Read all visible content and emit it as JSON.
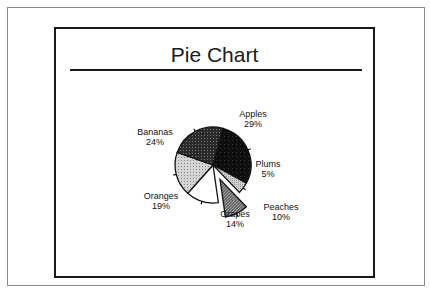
{
  "chart_data": {
    "type": "pie",
    "title": "Pie Chart",
    "slices": [
      {
        "label": "Apples",
        "value": 29,
        "text": "29%",
        "fill": "#111111",
        "pattern": "solid-dark",
        "exploded": false
      },
      {
        "label": "Plums",
        "value": 5,
        "text": "5%",
        "fill": "#c8c8c8",
        "pattern": "light",
        "exploded": false
      },
      {
        "label": "Peaches",
        "value": 10,
        "text": "10%",
        "fill": "#777777",
        "pattern": "hatch-mid",
        "exploded": true
      },
      {
        "label": "Grapes",
        "value": 14,
        "text": "14%",
        "fill": "#ffffff",
        "pattern": "none",
        "exploded": false
      },
      {
        "label": "Oranges",
        "value": 19,
        "text": "19%",
        "fill": "#c4c4c4",
        "pattern": "dots-light",
        "exploded": false
      },
      {
        "label": "Bananas",
        "value": 24,
        "text": "24%",
        "fill": "#3a3a3a",
        "pattern": "hatch-dark",
        "exploded": false
      }
    ],
    "start_angle_deg": -75,
    "direction": "clockwise",
    "legend": "none"
  }
}
